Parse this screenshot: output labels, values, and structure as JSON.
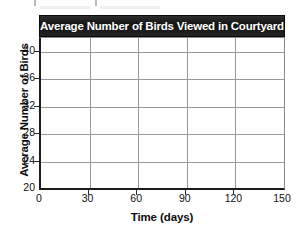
{
  "chart_data": {
    "type": "line",
    "title": "Average Number of Birds Viewed in Courtyard",
    "xlabel": "Time (days)",
    "ylabel": "Average Number of Birds",
    "xlim": [
      0,
      150
    ],
    "ylim": [
      20,
      42
    ],
    "xticks": [
      0,
      30,
      60,
      90,
      120,
      150
    ],
    "yticks": [
      20,
      24,
      28,
      32,
      36,
      40
    ],
    "xtick_labels": [
      "0",
      "30",
      "60",
      "90",
      "120",
      "150"
    ],
    "ytick_labels": [
      "20",
      "24",
      "28",
      "32",
      "36",
      "40"
    ],
    "grid": true,
    "legend": null,
    "series": [],
    "values": [],
    "annotations": []
  },
  "style": {
    "title_bar_background": "#1b1b1b",
    "title_text_color": "#ffffff",
    "plot_background": "#ffffff",
    "gridline_color": "#9a9a9a",
    "axis_color": "#1c1c1c",
    "tick_label_color": "#101010"
  }
}
